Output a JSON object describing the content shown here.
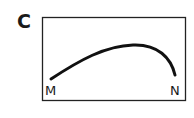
{
  "panel": {
    "label": "C",
    "points": {
      "start": "M",
      "end": "N"
    },
    "colors": {
      "stroke": "#111111",
      "background": "#ffffff"
    }
  }
}
